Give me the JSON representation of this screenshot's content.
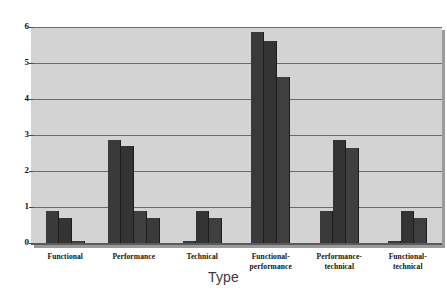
{
  "chart_data": {
    "type": "bar",
    "title": "",
    "xlabel": "Type",
    "ylabel": "",
    "ylim": [
      0,
      6
    ],
    "yticks": [
      0,
      1,
      2,
      3,
      4,
      5,
      6
    ],
    "ytick_labels": [
      "0",
      "1",
      "2",
      "3",
      "4",
      "5",
      "6"
    ],
    "grid": true,
    "legend": "none",
    "categories": [
      "Functional",
      "Performance",
      "Technical",
      "Functional-performance",
      "Performance-technical",
      "Functional-technical"
    ],
    "category_lines": [
      [
        "Functional"
      ],
      [
        "Performance"
      ],
      [
        "Technical"
      ],
      [
        "Functional-",
        "performance"
      ],
      [
        "Performance-",
        "technical"
      ],
      [
        "Functional-",
        "technical"
      ]
    ],
    "series": [
      {
        "name": "Series 1",
        "values": [
          0.9,
          2.85,
          0.05,
          5.85,
          0.9,
          0.05
        ]
      },
      {
        "name": "Series 2",
        "values": [
          0.7,
          2.7,
          0.9,
          5.6,
          2.85,
          0.9
        ]
      },
      {
        "name": "Series 3",
        "values": [
          0.05,
          0.9,
          0.7,
          4.6,
          2.65,
          0.7
        ]
      },
      {
        "name": "Series 4",
        "values": [
          0,
          0.7,
          0,
          0,
          0,
          0
        ]
      }
    ],
    "colors": {
      "bar_primary": "#3a3a3a",
      "bar_secondary": "#343434",
      "bar_tertiary": "#3f3f3f",
      "plot_background": "#d3d3d3",
      "gridline": "#6b6b6b",
      "axis": "#5a5a5a",
      "text": "#111111",
      "axis_title": "#3b3b3b"
    }
  }
}
